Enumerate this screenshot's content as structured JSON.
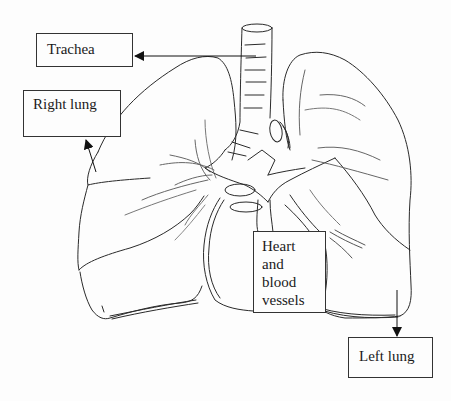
{
  "diagram": {
    "style": "pencil line drawing",
    "colors": {
      "background": "#fdfdfd",
      "stroke": "#2a2a2a",
      "box_border": "#333333",
      "text": "#1a1a1a"
    }
  },
  "labels": {
    "trachea": {
      "text": "Trachea"
    },
    "right_lung": {
      "text": "Right lung"
    },
    "heart": {
      "lines": [
        "Heart",
        "and",
        "blood",
        "vessels"
      ]
    },
    "left_lung": {
      "text": "Left lung"
    }
  }
}
